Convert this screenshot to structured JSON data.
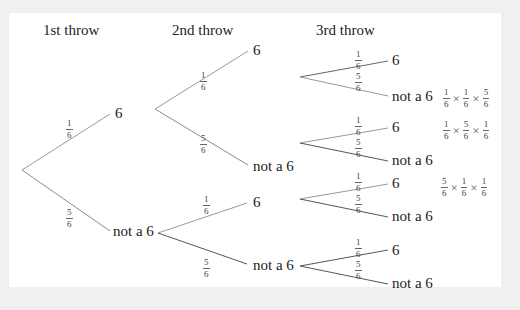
{
  "headers": [
    "1st throw",
    "2nd throw",
    "3rd throw"
  ],
  "outcome_labels": {
    "six": "6",
    "not_six": "not a 6"
  },
  "fractions": {
    "one_sixth": {
      "num": "1",
      "den": "6"
    },
    "five_sixths": {
      "num": "5",
      "den": "6"
    }
  },
  "nodes": [
    {
      "id": "t1-6",
      "text": "6",
      "x": 115,
      "y": 112
    },
    {
      "id": "t1-n6",
      "text": "not a 6",
      "x": 113,
      "y": 228
    },
    {
      "id": "t2-6a",
      "text": "6",
      "x": 253,
      "y": 43
    },
    {
      "id": "t2-n6a",
      "text": "not a 6",
      "x": 253,
      "y": 163
    },
    {
      "id": "t2-6b",
      "text": "6",
      "x": 253,
      "y": 201
    },
    {
      "id": "t2-n6b",
      "text": "not a 6",
      "x": 253,
      "y": 264
    },
    {
      "id": "t3-1",
      "text": "6",
      "x": 392,
      "y": 60
    },
    {
      "id": "t3-2",
      "text": "not a 6",
      "x": 392,
      "y": 95
    },
    {
      "id": "t3-3",
      "text": "6",
      "x": 392,
      "y": 127
    },
    {
      "id": "t3-4",
      "text": "not a 6",
      "x": 392,
      "y": 160
    },
    {
      "id": "t3-5",
      "text": "6",
      "x": 392,
      "y": 183
    },
    {
      "id": "t3-6",
      "text": "not a 6",
      "x": 392,
      "y": 216
    },
    {
      "id": "t3-7",
      "text": "6",
      "x": 392,
      "y": 249
    },
    {
      "id": "t3-8",
      "text": "not a 6",
      "x": 392,
      "y": 283
    }
  ],
  "products": [
    {
      "factors": [
        "1/6",
        "1/6",
        "5/6"
      ],
      "x": 443,
      "y": 95
    },
    {
      "factors": [
        "1/6",
        "5/6",
        "1/6"
      ],
      "x": 443,
      "y": 127
    },
    {
      "factors": [
        "5/6",
        "1/6",
        "1/6"
      ],
      "x": 441,
      "y": 183
    }
  ]
}
